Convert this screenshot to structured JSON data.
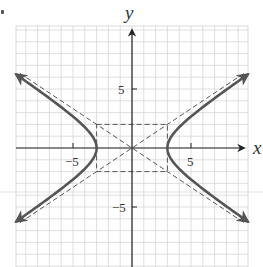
{
  "chart_data": {
    "type": "line",
    "title": "",
    "xlabel": "x",
    "ylabel": "y",
    "xlim": [
      -10,
      10
    ],
    "ylim": [
      -10,
      10.3
    ],
    "grid": true,
    "grid_step": 1,
    "x_ticks": [
      {
        "value": -5,
        "label": "−5"
      },
      {
        "value": 5,
        "label": "5"
      }
    ],
    "y_ticks": [
      {
        "value": 5,
        "label": "5"
      },
      {
        "value": -5,
        "label": "−5"
      }
    ],
    "equation": "x²/9 − y²/4 = 1",
    "a": 3,
    "b": 2,
    "vertices": [
      [
        -3,
        0
      ],
      [
        3,
        0
      ]
    ],
    "center": [
      0,
      0
    ],
    "series": [
      {
        "name": "hyperbola right branch",
        "style": "solid",
        "x": [
          9.8,
          8,
          6,
          4.5,
          3.5,
          3,
          3.5,
          4.5,
          6,
          8,
          9.8
        ],
        "y": [
          6.24,
          4.97,
          3.46,
          2.24,
          1.2,
          0,
          -1.2,
          -2.24,
          -3.46,
          -4.97,
          -6.24
        ]
      },
      {
        "name": "hyperbola left branch",
        "style": "solid",
        "x": [
          -9.8,
          -8,
          -6,
          -4.5,
          -3.5,
          -3,
          -3.5,
          -4.5,
          -6,
          -8,
          -9.8
        ],
        "y": [
          6.24,
          4.97,
          3.46,
          2.24,
          1.2,
          0,
          -1.2,
          -2.24,
          -3.46,
          -4.97,
          -6.24
        ]
      },
      {
        "name": "asymptote y = (2/3)x",
        "style": "dashed",
        "x": [
          -9.5,
          9.5
        ],
        "y": [
          -6.33,
          6.33
        ]
      },
      {
        "name": "asymptote y = -(2/3)x",
        "style": "dashed",
        "x": [
          -9.5,
          9.5
        ],
        "y": [
          6.33,
          -6.33
        ]
      },
      {
        "name": "central rectangle",
        "style": "dashed",
        "x": [
          -3,
          3,
          3,
          -3,
          -3
        ],
        "y": [
          2,
          2,
          -2,
          -2,
          2
        ]
      }
    ]
  },
  "labels": {
    "x_axis": "x",
    "y_axis": "y",
    "tick_neg5_x": "−5",
    "tick_pos5_x": "5",
    "tick_pos5_y": "5",
    "tick_neg5_y": "−5"
  }
}
